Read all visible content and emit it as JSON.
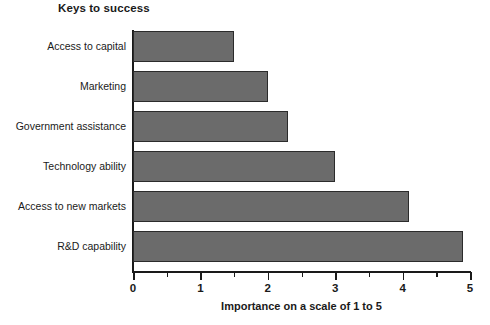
{
  "chart_data": {
    "type": "bar",
    "orientation": "horizontal",
    "title": "Keys to success",
    "xlabel": "Importance on a scale of 1 to 5",
    "ylabel": "",
    "categories": [
      "Access to capital",
      "Marketing",
      "Government assistance",
      "Technology ability",
      "Access to new markets",
      "R&D capability"
    ],
    "values": [
      1.5,
      2.0,
      2.3,
      3.0,
      4.1,
      4.9
    ],
    "xlim": [
      0,
      5
    ],
    "xticks": [
      0,
      1,
      2,
      3,
      4,
      5
    ],
    "xtick_labels": [
      "0",
      "1",
      "2",
      "3",
      "4",
      "5"
    ],
    "minor_xticks": [
      0.5,
      1.5,
      2.5,
      3.5,
      4.5
    ],
    "grid": false,
    "legend": null,
    "bar_color": "#6b6b6b",
    "bar_edge_color": "#2b2b2b",
    "background": "#ffffff",
    "axis_color": "#1a1a1a"
  }
}
